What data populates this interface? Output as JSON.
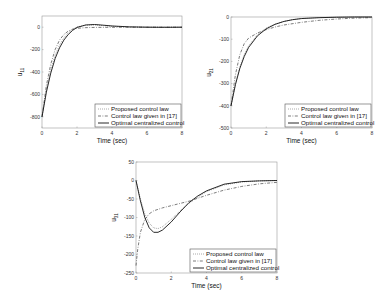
{
  "chart_data": [
    {
      "type": "line",
      "ylabel": "u_11",
      "xlabel": "Time (sec)",
      "xlim": [
        0,
        8
      ],
      "ylim": [
        -900,
        100
      ],
      "xticks": [
        0,
        2,
        4,
        6,
        8
      ],
      "yticks": [
        0,
        -200,
        -400,
        -600,
        -800
      ],
      "grid": false,
      "legend_position": "lower right",
      "series": [
        {
          "name": "Proposed control law",
          "style": "dotted",
          "x": [
            0,
            0.25,
            0.5,
            0.75,
            1,
            1.25,
            1.5,
            1.75,
            2,
            2.5,
            3,
            3.5,
            4,
            5,
            6,
            7,
            8
          ],
          "y": [
            -800,
            -560,
            -380,
            -250,
            -160,
            -95,
            -50,
            -18,
            2,
            18,
            20,
            14,
            8,
            2,
            0,
            0,
            0
          ]
        },
        {
          "name": "Control law given in [17]",
          "style": "dashdot",
          "x": [
            0,
            0.25,
            0.5,
            0.75,
            1,
            1.25,
            1.5,
            1.75,
            2,
            2.5,
            3,
            4,
            5,
            6,
            7,
            8
          ],
          "y": [
            -800,
            -520,
            -330,
            -200,
            -115,
            -65,
            -35,
            -18,
            -10,
            -4,
            -2,
            -1,
            0,
            0,
            0,
            0
          ]
        },
        {
          "name": "Optimal centralized control",
          "style": "solid",
          "x": [
            0,
            0.25,
            0.5,
            0.75,
            1,
            1.25,
            1.5,
            1.75,
            2,
            2.5,
            3,
            3.5,
            4,
            5,
            6,
            7,
            8
          ],
          "y": [
            -800,
            -580,
            -410,
            -280,
            -185,
            -115,
            -65,
            -28,
            -2,
            20,
            24,
            18,
            11,
            3,
            0,
            -1,
            0
          ]
        }
      ]
    },
    {
      "type": "line",
      "ylabel": "u_21",
      "xlabel": "Time (sec)",
      "xlim": [
        0,
        8
      ],
      "ylim": [
        -500,
        0
      ],
      "xticks": [
        0,
        2,
        4,
        6,
        8
      ],
      "yticks": [
        0,
        -100,
        -200,
        -300,
        -400,
        -500
      ],
      "grid": false,
      "legend_position": "lower right",
      "series": [
        {
          "name": "Proposed control law",
          "style": "dotted",
          "x": [
            0,
            0.25,
            0.5,
            0.75,
            1,
            1.5,
            2,
            2.5,
            3,
            3.5,
            4,
            5,
            6,
            7,
            8
          ],
          "y": [
            -400,
            -300,
            -225,
            -170,
            -130,
            -80,
            -50,
            -32,
            -20,
            -12,
            -7,
            -3,
            -1,
            0,
            0
          ]
        },
        {
          "name": "Control law given in [17]",
          "style": "dashdot",
          "x": [
            0,
            0.25,
            0.5,
            0.75,
            1,
            1.5,
            2,
            2.5,
            3,
            4,
            5,
            6,
            7,
            8
          ],
          "y": [
            -400,
            -260,
            -170,
            -120,
            -95,
            -72,
            -57,
            -45,
            -36,
            -24,
            -15,
            -9,
            -5,
            -3
          ]
        },
        {
          "name": "Optimal centralized control",
          "style": "solid",
          "x": [
            0,
            0.25,
            0.5,
            0.75,
            1,
            1.5,
            2,
            2.5,
            3,
            3.5,
            4,
            5,
            6,
            7,
            8
          ],
          "y": [
            -400,
            -305,
            -232,
            -178,
            -137,
            -85,
            -53,
            -33,
            -20,
            -12,
            -7,
            -3,
            -1,
            0,
            0
          ]
        }
      ]
    },
    {
      "type": "line",
      "ylabel": "u_31",
      "xlabel": "Time (sec)",
      "xlim": [
        0,
        8
      ],
      "ylim": [
        -250,
        50
      ],
      "xticks": [
        0,
        2,
        4,
        6,
        8
      ],
      "yticks": [
        50,
        0,
        -50,
        -100,
        -150,
        -200,
        -250
      ],
      "grid": false,
      "legend_position": "lower right",
      "series": [
        {
          "name": "Proposed control law",
          "style": "dotted",
          "x": [
            0,
            0.25,
            0.5,
            0.75,
            1,
            1.25,
            1.5,
            2,
            2.5,
            3,
            3.5,
            4,
            5,
            6,
            7,
            8
          ],
          "y": [
            0,
            -50,
            -90,
            -115,
            -128,
            -130,
            -125,
            -105,
            -82,
            -62,
            -45,
            -30,
            -12,
            -4,
            -1,
            0
          ]
        },
        {
          "name": "Control law given in [17]",
          "style": "dashdot",
          "x": [
            0,
            0.1,
            0.25,
            0.5,
            0.75,
            1,
            1.5,
            2,
            2.5,
            3,
            3.5,
            4,
            5,
            6,
            7,
            8
          ],
          "y": [
            -230,
            -185,
            -140,
            -105,
            -90,
            -82,
            -74,
            -68,
            -62,
            -56,
            -48,
            -40,
            -26,
            -16,
            -9,
            -5
          ]
        },
        {
          "name": "Optimal centralized control",
          "style": "solid",
          "x": [
            0,
            0.25,
            0.5,
            0.75,
            1,
            1.25,
            1.5,
            2,
            2.5,
            3,
            3.5,
            4,
            5,
            6,
            7,
            8
          ],
          "y": [
            0,
            -55,
            -100,
            -128,
            -140,
            -140,
            -134,
            -112,
            -85,
            -60,
            -42,
            -28,
            -10,
            -3,
            -1,
            0
          ]
        }
      ]
    }
  ],
  "legend_labels": [
    "Proposed control law",
    "Control law given in [17]",
    "Optimal centralized control"
  ],
  "xlabel": "Time (sec)",
  "ylabels": [
    "u",
    "u",
    "u"
  ],
  "ylabel_subs": [
    "11",
    "21",
    "31"
  ]
}
